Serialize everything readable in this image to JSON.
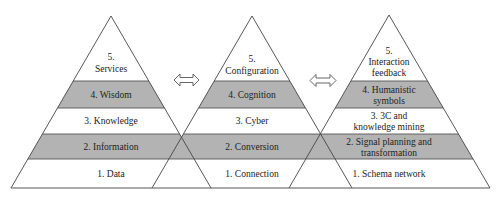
{
  "colors": {
    "gray_band": "#b3b3b3",
    "line": "#444444",
    "background": "#ffffff"
  },
  "pyramids": [
    {
      "name": "left",
      "layers": [
        {
          "level": 5,
          "lines": [
            "5.",
            "Services"
          ]
        },
        {
          "level": 4,
          "lines": [
            "4. Wisdom"
          ]
        },
        {
          "level": 3,
          "lines": [
            "3. Knowledge"
          ]
        },
        {
          "level": 2,
          "lines": [
            "2. Information"
          ]
        },
        {
          "level": 1,
          "lines": [
            "1. Data"
          ]
        }
      ]
    },
    {
      "name": "middle",
      "layers": [
        {
          "level": 5,
          "lines": [
            "5.",
            "Configuration"
          ]
        },
        {
          "level": 4,
          "lines": [
            "4. Cognition"
          ]
        },
        {
          "level": 3,
          "lines": [
            "3. Cyber"
          ]
        },
        {
          "level": 2,
          "lines": [
            "2. Conversion"
          ]
        },
        {
          "level": 1,
          "lines": [
            "1. Connection"
          ]
        }
      ]
    },
    {
      "name": "right",
      "layers": [
        {
          "level": 5,
          "lines": [
            "5.",
            "Interaction",
            "feedback"
          ]
        },
        {
          "level": 4,
          "lines": [
            "4. Humanistic",
            "symbols"
          ]
        },
        {
          "level": 3,
          "lines": [
            "3. 3C and",
            "knowledge mining"
          ]
        },
        {
          "level": 2,
          "lines": [
            "2. Signal planning and",
            "transformation"
          ]
        },
        {
          "level": 1,
          "lines": [
            "1. Schema network"
          ]
        }
      ]
    }
  ],
  "arrows": [
    {
      "name": "double-arrow-left-middle",
      "direction": "bidirectional"
    },
    {
      "name": "double-arrow-middle-right",
      "direction": "bidirectional"
    }
  ]
}
